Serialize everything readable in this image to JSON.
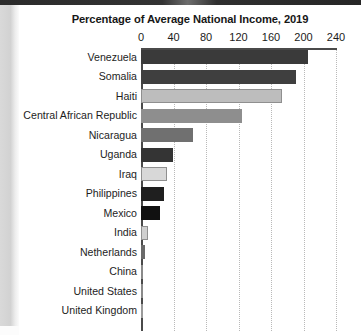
{
  "chart_data": {
    "type": "bar",
    "orientation": "horizontal",
    "title": "Percentage of Average National Income, 2019",
    "xlabel": "",
    "ylabel": "",
    "xlim": [
      0,
      240
    ],
    "xticks": [
      0,
      40,
      80,
      120,
      160,
      200,
      240
    ],
    "xtick_labels": [
      "0",
      "40",
      "80",
      "120",
      "160",
      "200",
      "240"
    ],
    "grid": "vertical-dotted",
    "legend": "none",
    "categories": [
      "Venezuela",
      "Somalia",
      "Haiti",
      "Central African Republic",
      "Nicaragua",
      "Uganda",
      "Iraq",
      "Philippines",
      "Mexico",
      "India",
      "Netherlands",
      "China",
      "United States",
      "United Kingdom"
    ],
    "values": [
      205,
      191,
      173,
      124,
      64,
      39,
      32,
      28,
      23,
      9,
      5,
      1,
      1,
      0
    ],
    "bar_colors": [
      "#3a3a3a",
      "#3f3f3f",
      "#bdbdbd",
      "#8e8e8e",
      "#707070",
      "#343434",
      "#d8d8d8",
      "#1f1f1f",
      "#111111",
      "#cfcfcf",
      "#6a6a6a",
      "#8a8a8a",
      "#8a8a8a",
      "#9a9a9a"
    ]
  },
  "artifacts": {
    "top_band": "scan-edge-dark-band",
    "left_strip": "scan-edge-gray-strip"
  }
}
